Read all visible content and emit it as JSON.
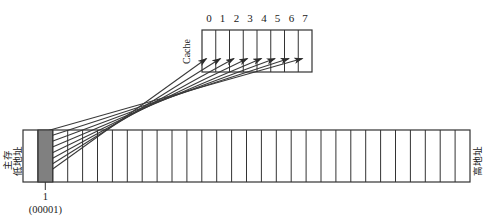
{
  "diagram": {
    "colors": {
      "stroke": "#333333",
      "shaded_cell_fill": "#808080",
      "background": "#ffffff",
      "text": "#1a1a1a"
    },
    "cache": {
      "label": "Cache",
      "label_rotation": "-90",
      "cell_count": 8,
      "cell_labels": [
        "0",
        "1",
        "2",
        "3",
        "4",
        "5",
        "6",
        "7"
      ],
      "box": {
        "x": 202,
        "y": 30,
        "width": 110,
        "height": 42
      },
      "cell_width": 13.75
    },
    "memory": {
      "label_main": "主存",
      "label_low_address": "低地址",
      "label_high_address": "高地址",
      "label_rotation": "-90",
      "cell_count": 30,
      "shaded_cell_index": 1,
      "box": {
        "x": 23,
        "y": 130,
        "width": 447,
        "height": 52
      },
      "cell_width": 14.9,
      "address_decimal": "1",
      "address_binary": "(00001)"
    },
    "mapping_arrows": {
      "count": 8,
      "description": "arrows from shaded main-memory block to each cache line",
      "source_cell_index": 1,
      "target_cells": [
        "0",
        "1",
        "2",
        "3",
        "4",
        "5",
        "6",
        "7"
      ]
    }
  }
}
